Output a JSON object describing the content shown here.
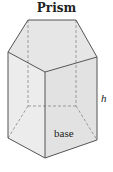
{
  "title": "Prism",
  "labels": {
    "height": "h",
    "base": "base"
  },
  "colors": {
    "edge": "#555555",
    "face_top": "#e4e4e4",
    "face_left": "#e9e9e9",
    "face_right": "#dedede",
    "dashed": "#777777"
  }
}
